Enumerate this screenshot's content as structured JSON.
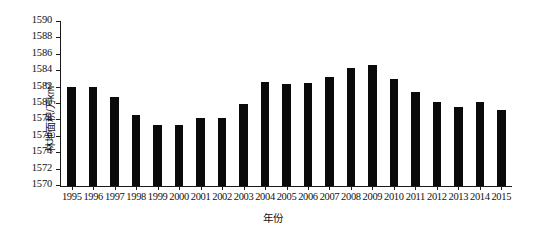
{
  "chart_data": {
    "type": "bar",
    "title": "",
    "xlabel": "年份",
    "ylabel": "林地面积/万km²",
    "ylabel_base": "林地面积/万km",
    "ylabel_sup": "2",
    "ylim": [
      1570,
      1590
    ],
    "yticks": [
      1570,
      1572,
      1574,
      1576,
      1578,
      1580,
      1582,
      1584,
      1586,
      1588,
      1590
    ],
    "ytick_labels": [
      "1570",
      "1572",
      "1574",
      "1576",
      "1578",
      "1580",
      "1582",
      "1584",
      "1586",
      "1588",
      "1590"
    ],
    "grid": false,
    "legend": null,
    "bar_color": "#0a0a0a",
    "axis_color": "#1a1a1a",
    "categories": [
      "1995",
      "1996",
      "1997",
      "1998",
      "1999",
      "2000",
      "2001",
      "2002",
      "2003",
      "2004",
      "2005",
      "2006",
      "2007",
      "2008",
      "2009",
      "2010",
      "2011",
      "2012",
      "2013",
      "2014",
      "2015"
    ],
    "values": [
      1582.1,
      1582.1,
      1580.9,
      1578.7,
      1577.5,
      1577.45,
      1578.3,
      1578.3,
      1580.0,
      1582.7,
      1582.4,
      1582.6,
      1583.3,
      1584.4,
      1584.8,
      1583.1,
      1581.5,
      1580.3,
      1579.6,
      1580.2,
      1579.3
    ]
  }
}
